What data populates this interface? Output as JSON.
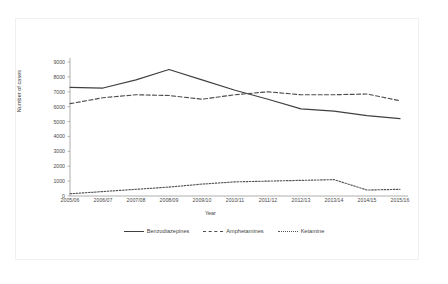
{
  "figure": {
    "background": "#ffffff",
    "frame_color": "#f0f0f0"
  },
  "chart_data": {
    "type": "line",
    "title": "",
    "xlabel": "Year",
    "ylabel": "Number of cases",
    "categories": [
      "2005/06",
      "2006/07",
      "2007/08",
      "2008/09",
      "2009/10",
      "2010/11",
      "2011/12",
      "2012/13",
      "2013/14",
      "2014/15",
      "2015/16"
    ],
    "ylim": [
      0,
      9000
    ],
    "yticks": [
      0,
      1000,
      2000,
      3000,
      4000,
      5000,
      6000,
      7000,
      8000,
      9000
    ],
    "ytick_labels": [
      "0",
      "1000",
      "2000",
      "3000",
      "4000",
      "5000",
      "6000",
      "7000",
      "8000",
      "9000"
    ],
    "grid": false,
    "legend_position": "bottom",
    "series": [
      {
        "name": "Benzodiazepines",
        "style": "solid",
        "color": "#404040",
        "values": [
          7300,
          7250,
          7800,
          8500,
          7800,
          7100,
          6500,
          5850,
          5700,
          5400,
          5200
        ]
      },
      {
        "name": "Amphetamines",
        "style": "dashed",
        "color": "#4d4d4d",
        "values": [
          6200,
          6600,
          6800,
          6750,
          6500,
          6800,
          7000,
          6800,
          6800,
          6850,
          6400
        ]
      },
      {
        "name": "Ketamine",
        "style": "dotted",
        "color": "#555555",
        "values": [
          150,
          300,
          450,
          600,
          800,
          950,
          1000,
          1050,
          1100,
          400,
          450
        ]
      }
    ]
  }
}
